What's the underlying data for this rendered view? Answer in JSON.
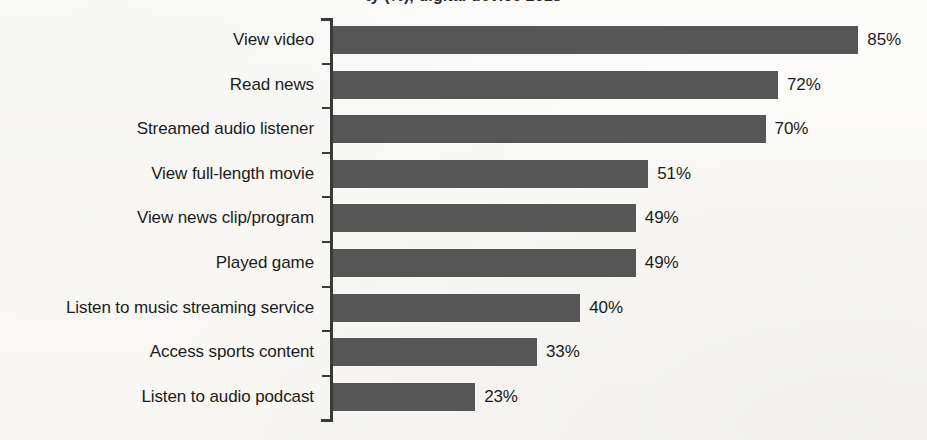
{
  "chart_data": {
    "type": "bar",
    "orientation": "horizontal",
    "title": "ty (%), digital device 2018",
    "xlabel": "",
    "ylabel": "",
    "xlim": [
      0,
      100
    ],
    "grid": false,
    "legend": "none",
    "value_suffix": "%",
    "categories": [
      "View video",
      "Read news",
      "Streamed audio listener",
      "View full-length movie",
      "View news clip/program",
      "Played game",
      "Listen to music streaming service",
      "Access sports content",
      "Listen to audio podcast"
    ],
    "values": [
      85,
      72,
      70,
      51,
      49,
      49,
      40,
      33,
      23
    ],
    "value_labels": [
      "85%",
      "72%",
      "70%",
      "51%",
      "49%",
      "49%",
      "40%",
      "33%",
      "23%"
    ],
    "bar_color": "#565656",
    "text_color": "#1c1c1c",
    "background_color": "#fbfbf9"
  }
}
